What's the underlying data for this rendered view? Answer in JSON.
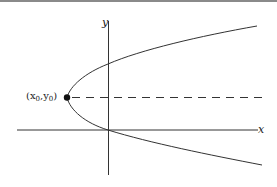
{
  "diagram": {
    "type": "parabola-horizontal",
    "axes": {
      "x_label": "x",
      "y_label": "y"
    },
    "vertex": {
      "label_x": "x",
      "label_y": "y",
      "subscript": "0",
      "open": "(",
      "sep": ",",
      "close": ")"
    },
    "elements": [
      "x-axis",
      "y-axis",
      "parabola opening right",
      "vertex point",
      "dashed horizontal line through vertex"
    ],
    "colors": {
      "stroke": "#333333",
      "border": "#8a8a8a"
    }
  }
}
